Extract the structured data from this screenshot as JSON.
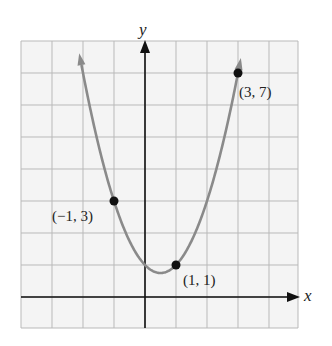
{
  "chart_data": {
    "type": "line",
    "title": "",
    "xlabel": "x",
    "ylabel": "y",
    "function": "y = x^2 - x + 1",
    "xlim": [
      -4,
      5
    ],
    "ylim": [
      -1,
      8
    ],
    "grid": true,
    "grid_step": 1,
    "curve_color": "#8a8a8a",
    "point_color": "#111111",
    "points": [
      {
        "x": -1,
        "y": 3,
        "label": "(−1, 3)"
      },
      {
        "x": 1,
        "y": 1,
        "label": "(1, 1)"
      },
      {
        "x": 3,
        "y": 7,
        "label": "(3, 7)"
      }
    ]
  },
  "labels": {
    "x_axis": "x",
    "y_axis": "y",
    "p1": "(−1, 3)",
    "p2": "(1, 1)",
    "p3": "(3, 7)"
  }
}
